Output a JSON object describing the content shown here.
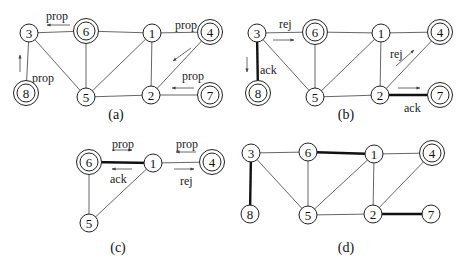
{
  "figure": {
    "panels": [
      {
        "id": "a",
        "caption": "(a)",
        "caption_pos": [
          116,
          119
        ],
        "nodes": [
          {
            "id": "3",
            "label": "3",
            "x": 29,
            "y": 33,
            "double": false
          },
          {
            "id": "6",
            "label": "6",
            "x": 86,
            "y": 31,
            "double": true
          },
          {
            "id": "1",
            "label": "1",
            "x": 152,
            "y": 33,
            "double": false
          },
          {
            "id": "4",
            "label": "4",
            "x": 210,
            "y": 32,
            "double": true
          },
          {
            "id": "8",
            "label": "8",
            "x": 26,
            "y": 93,
            "double": true
          },
          {
            "id": "5",
            "label": "5",
            "x": 86,
            "y": 97,
            "double": false
          },
          {
            "id": "2",
            "label": "2",
            "x": 151,
            "y": 95,
            "double": false
          },
          {
            "id": "7",
            "label": "7",
            "x": 210,
            "y": 95,
            "double": true
          }
        ],
        "edges": [
          {
            "from": "3",
            "to": "6",
            "bold": false
          },
          {
            "from": "6",
            "to": "1",
            "bold": false
          },
          {
            "from": "1",
            "to": "4",
            "bold": false
          },
          {
            "from": "3",
            "to": "8",
            "bold": false
          },
          {
            "from": "3",
            "to": "5",
            "bold": false
          },
          {
            "from": "6",
            "to": "5",
            "bold": false
          },
          {
            "from": "5",
            "to": "1",
            "bold": false
          },
          {
            "from": "1",
            "to": "2",
            "bold": false
          },
          {
            "from": "5",
            "to": "2",
            "bold": false
          },
          {
            "from": "2",
            "to": "4",
            "bold": false
          },
          {
            "from": "2",
            "to": "7",
            "bold": false
          }
        ],
        "messages": [
          {
            "label": "prop",
            "tx": 46,
            "ty": 20,
            "ax1": 70,
            "ay1": 25,
            "ax2": 47,
            "ay2": 25
          },
          {
            "label": "prop",
            "tx": 32,
            "ty": 82,
            "ax1": 20,
            "ay1": 72,
            "ax2": 20,
            "ay2": 55
          },
          {
            "label": "prop",
            "tx": 175,
            "ty": 29,
            "ax1": null,
            "ay1": null,
            "ax2": null,
            "ay2": null
          },
          {
            "label": "",
            "tx": null,
            "ty": null,
            "ax1": 191,
            "ay1": 48,
            "ax2": 173,
            "ay2": 61
          },
          {
            "label": "prop",
            "tx": 182,
            "ty": 80,
            "ax1": 194,
            "ay1": 88,
            "ax2": 172,
            "ay2": 88
          }
        ]
      },
      {
        "id": "b",
        "caption": "(b)",
        "caption_pos": [
          346,
          119
        ],
        "nodes": [
          {
            "id": "3",
            "label": "3",
            "x": 257,
            "y": 33,
            "double": false
          },
          {
            "id": "6",
            "label": "6",
            "x": 315,
            "y": 32,
            "double": true
          },
          {
            "id": "1",
            "label": "1",
            "x": 381,
            "y": 33,
            "double": false
          },
          {
            "id": "4",
            "label": "4",
            "x": 440,
            "y": 32,
            "double": true
          },
          {
            "id": "8",
            "label": "8",
            "x": 258,
            "y": 93,
            "double": true
          },
          {
            "id": "5",
            "label": "5",
            "x": 315,
            "y": 97,
            "double": false
          },
          {
            "id": "2",
            "label": "2",
            "x": 380,
            "y": 95,
            "double": false
          },
          {
            "id": "7",
            "label": "7",
            "x": 440,
            "y": 95,
            "double": true
          }
        ],
        "edges": [
          {
            "from": "3",
            "to": "6",
            "bold": false
          },
          {
            "from": "6",
            "to": "1",
            "bold": false
          },
          {
            "from": "1",
            "to": "4",
            "bold": false
          },
          {
            "from": "3",
            "to": "8",
            "bold": true
          },
          {
            "from": "3",
            "to": "5",
            "bold": false
          },
          {
            "from": "6",
            "to": "5",
            "bold": false
          },
          {
            "from": "5",
            "to": "1",
            "bold": false
          },
          {
            "from": "1",
            "to": "2",
            "bold": false
          },
          {
            "from": "5",
            "to": "2",
            "bold": false
          },
          {
            "from": "2",
            "to": "4",
            "bold": false
          },
          {
            "from": "2",
            "to": "7",
            "bold": true
          }
        ],
        "messages": [
          {
            "label": "rej",
            "tx": 279,
            "ty": 28,
            "ax1": 273,
            "ay1": 40,
            "ax2": 294,
            "ay2": 40
          },
          {
            "label": "ack",
            "tx": 260,
            "ty": 74,
            "ax1": 247,
            "ay1": 57,
            "ax2": 247,
            "ay2": 72
          },
          {
            "label": "rej",
            "tx": 390,
            "ty": 58,
            "ax1": 396,
            "ay1": 66,
            "ax2": 414,
            "ay2": 50
          },
          {
            "label": "ack",
            "tx": 404,
            "ty": 112,
            "ax1": 398,
            "ay1": 88,
            "ax2": 420,
            "ay2": 88
          }
        ]
      },
      {
        "id": "c",
        "caption": "(c)",
        "caption_pos": [
          118,
          252
        ],
        "nodes": [
          {
            "id": "6",
            "label": "6",
            "x": 89,
            "y": 162,
            "double": true
          },
          {
            "id": "1",
            "label": "1",
            "x": 153,
            "y": 163,
            "double": false
          },
          {
            "id": "4",
            "label": "4",
            "x": 212,
            "y": 162,
            "double": true
          },
          {
            "id": "5",
            "label": "5",
            "x": 89,
            "y": 223,
            "double": false
          }
        ],
        "edges": [
          {
            "from": "6",
            "to": "1",
            "bold": true
          },
          {
            "from": "1",
            "to": "4",
            "bold": false
          },
          {
            "from": "6",
            "to": "5",
            "bold": false
          },
          {
            "from": "5",
            "to": "1",
            "bold": false
          }
        ],
        "messages": [
          {
            "label": "prop",
            "tx": 112,
            "ty": 148,
            "ax1": 112,
            "ay1": 150,
            "ax2": 132,
            "ay2": 150
          },
          {
            "label": "ack",
            "tx": 110,
            "ty": 183,
            "ax1": 132,
            "ay1": 169,
            "ax2": 112,
            "ay2": 169
          },
          {
            "label": "prop",
            "tx": 176,
            "ty": 148,
            "ax1": 196,
            "ay1": 152,
            "ax2": 176,
            "ay2": 152
          },
          {
            "label": "rej",
            "tx": 180,
            "ty": 185,
            "ax1": 174,
            "ay1": 169,
            "ax2": 194,
            "ay2": 169
          }
        ]
      },
      {
        "id": "d",
        "caption": "(d)",
        "caption_pos": [
          346,
          252
        ],
        "nodes": [
          {
            "id": "3",
            "label": "3",
            "x": 251,
            "y": 153,
            "double": false
          },
          {
            "id": "6",
            "label": "6",
            "x": 308,
            "y": 152,
            "double": false
          },
          {
            "id": "1",
            "label": "1",
            "x": 374,
            "y": 154,
            "double": false
          },
          {
            "id": "4",
            "label": "4",
            "x": 432,
            "y": 153,
            "double": true
          },
          {
            "id": "8",
            "label": "8",
            "x": 250,
            "y": 214,
            "double": false
          },
          {
            "id": "5",
            "label": "5",
            "x": 308,
            "y": 215,
            "double": false
          },
          {
            "id": "2",
            "label": "2",
            "x": 373,
            "y": 214,
            "double": false
          },
          {
            "id": "7",
            "label": "7",
            "x": 431,
            "y": 214,
            "double": false
          }
        ],
        "edges": [
          {
            "from": "3",
            "to": "6",
            "bold": false
          },
          {
            "from": "6",
            "to": "1",
            "bold": true
          },
          {
            "from": "1",
            "to": "4",
            "bold": false
          },
          {
            "from": "3",
            "to": "8",
            "bold": true
          },
          {
            "from": "3",
            "to": "5",
            "bold": false
          },
          {
            "from": "6",
            "to": "5",
            "bold": false
          },
          {
            "from": "5",
            "to": "1",
            "bold": false
          },
          {
            "from": "1",
            "to": "2",
            "bold": false
          },
          {
            "from": "5",
            "to": "2",
            "bold": false
          },
          {
            "from": "2",
            "to": "4",
            "bold": false
          },
          {
            "from": "2",
            "to": "7",
            "bold": true
          }
        ],
        "messages": []
      }
    ]
  }
}
